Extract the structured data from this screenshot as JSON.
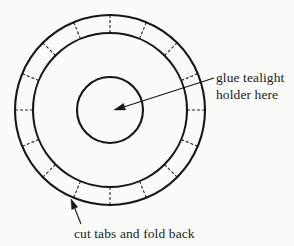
{
  "diagram": {
    "background_color": "#fbfbfa",
    "ink_color": "#161616",
    "center": {
      "x": 110,
      "y": 110
    },
    "circles": [
      {
        "name": "outer-circle",
        "radius": 95,
        "stroke_width": 2.1,
        "style": "solid"
      },
      {
        "name": "middle-circle",
        "radius": 77,
        "stroke_width": 2.1,
        "style": "solid"
      },
      {
        "name": "inner-circle",
        "radius": 33,
        "stroke_width": 2.1,
        "style": "solid"
      }
    ],
    "tabs": {
      "name": "cut-tab-dashed-lines",
      "count": 16,
      "angle_step_degrees": 22.5,
      "start_angle_degrees": 0,
      "inner_radius": 77,
      "outer_radius": 95,
      "style": "dashed",
      "dash_pattern": "3 2",
      "stroke_width": 1.1
    }
  },
  "annotations": {
    "glue": {
      "name": "glue-tealight-annotation",
      "line1": "glue tealight",
      "line2": "holder here",
      "text_x": 216,
      "text_y": 70,
      "leader": {
        "name": "glue-leader-arrow",
        "from_x": 214,
        "from_y": 78,
        "to_x": 114,
        "to_y": 110,
        "arrowhead": "at-target"
      }
    },
    "cut": {
      "name": "cut-tabs-annotation",
      "text": "cut tabs and fold back",
      "text_x": 74,
      "text_y": 226,
      "leader": {
        "name": "cut-leader-arrow",
        "from_x": 81,
        "from_y": 224,
        "to_x": 71,
        "to_y": 199,
        "arrowhead": "at-target"
      }
    }
  }
}
